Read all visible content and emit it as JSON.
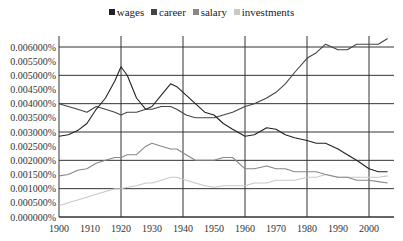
{
  "chart_data": {
    "type": "line",
    "title": "",
    "xlabel": "",
    "ylabel": "",
    "xlim": [
      1900,
      2008
    ],
    "ylim": [
      0,
      0.006
    ],
    "y_tick_labels": [
      "0.000000%",
      "0.000500%",
      "0.001000%",
      "0.001500%",
      "0.002000%",
      "0.002500%",
      "0.003000%",
      "0.003500%",
      "0.004000%",
      "0.004500%",
      "0.005000%",
      "0.005500%",
      "0.006000%"
    ],
    "x_tick_labels": [
      "1900",
      "1910",
      "1920",
      "1930",
      "1940",
      "1950",
      "1960",
      "1970",
      "1980",
      "1990",
      "2000"
    ],
    "grid": {
      "horizontal_every": 0.001,
      "vertical_every_years": 20
    },
    "legend_position": "top",
    "x": [
      1900,
      1903,
      1906,
      1909,
      1912,
      1915,
      1918,
      1920,
      1922,
      1925,
      1928,
      1930,
      1933,
      1936,
      1938,
      1941,
      1944,
      1947,
      1950,
      1953,
      1956,
      1960,
      1963,
      1967,
      1970,
      1973,
      1976,
      1980,
      1983,
      1986,
      1990,
      1993,
      1996,
      2000,
      2003,
      2006
    ],
    "series": [
      {
        "name": "wages",
        "color": "#222222",
        "values": [
          0.00285,
          0.0029,
          0.00305,
          0.0033,
          0.0038,
          0.0042,
          0.0048,
          0.0053,
          0.005,
          0.0042,
          0.0038,
          0.0039,
          0.0043,
          0.0047,
          0.0046,
          0.0043,
          0.004,
          0.0037,
          0.0036,
          0.0033,
          0.0031,
          0.00285,
          0.0029,
          0.00315,
          0.0031,
          0.0029,
          0.0028,
          0.0027,
          0.0026,
          0.0026,
          0.0024,
          0.0022,
          0.002,
          0.0017,
          0.0016,
          0.0016
        ]
      },
      {
        "name": "career",
        "color": "#444444",
        "values": [
          0.004,
          0.0039,
          0.0038,
          0.0037,
          0.0039,
          0.0038,
          0.0037,
          0.0036,
          0.0037,
          0.0037,
          0.0038,
          0.0038,
          0.0039,
          0.0039,
          0.0038,
          0.0036,
          0.0035,
          0.0035,
          0.0035,
          0.0036,
          0.0037,
          0.0039,
          0.004,
          0.0042,
          0.0044,
          0.0047,
          0.0051,
          0.0056,
          0.0058,
          0.0061,
          0.0059,
          0.0059,
          0.0061,
          0.0061,
          0.0061,
          0.0063
        ]
      },
      {
        "name": "salary",
        "color": "#888888",
        "values": [
          0.00145,
          0.0015,
          0.00165,
          0.0017,
          0.0019,
          0.002,
          0.0021,
          0.0021,
          0.0022,
          0.0022,
          0.0025,
          0.0026,
          0.0025,
          0.0024,
          0.0024,
          0.0022,
          0.002,
          0.002,
          0.002,
          0.0021,
          0.0021,
          0.0017,
          0.0017,
          0.0018,
          0.0017,
          0.0017,
          0.0016,
          0.0016,
          0.0016,
          0.0015,
          0.0014,
          0.0014,
          0.0013,
          0.0013,
          0.00125,
          0.0012
        ]
      },
      {
        "name": "investments",
        "color": "#c8c8c8",
        "values": [
          0.0004,
          0.0005,
          0.0006,
          0.0007,
          0.0008,
          0.0009,
          0.001,
          0.001,
          0.00105,
          0.0011,
          0.0012,
          0.0012,
          0.0013,
          0.0014,
          0.0014,
          0.0013,
          0.0012,
          0.0011,
          0.00105,
          0.0011,
          0.0011,
          0.0011,
          0.0012,
          0.0012,
          0.0013,
          0.0013,
          0.0013,
          0.0014,
          0.0014,
          0.0015,
          0.0014,
          0.0014,
          0.0014,
          0.0014,
          0.0014,
          0.00145
        ]
      }
    ]
  },
  "legend": {
    "items": [
      {
        "label": "wages",
        "color": "#222222"
      },
      {
        "label": "career",
        "color": "#444444"
      },
      {
        "label": "salary",
        "color": "#888888"
      },
      {
        "label": "investments",
        "color": "#c8c8c8"
      }
    ]
  }
}
